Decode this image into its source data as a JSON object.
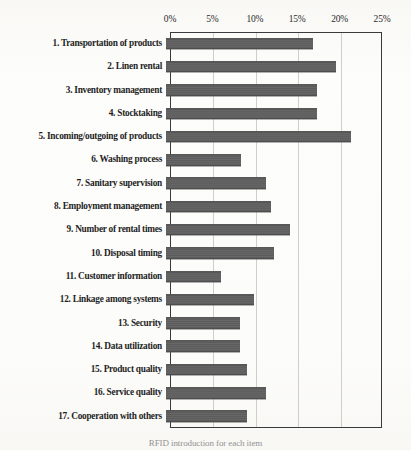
{
  "chart_data": {
    "type": "bar",
    "orientation": "horizontal",
    "title": "",
    "xlabel": "",
    "ylabel": "",
    "xlim": [
      0,
      25
    ],
    "xticks": [
      0,
      5,
      10,
      15,
      20,
      25
    ],
    "xtick_labels": [
      "0%",
      "5%",
      "10%",
      "15%",
      "20%",
      "25%"
    ],
    "x_axis_position": "top",
    "grid": true,
    "grid_axis": "x",
    "legend": "none",
    "bar_color": "#5e5e5e",
    "frame_color": "#3a3a3a",
    "categories": [
      "1. Transportation of products",
      "2. Linen rental",
      "3. Inventory management",
      "4. Stocktaking",
      "5. Incoming/outgoing of products",
      "6. Washing process",
      "7. Sanitary supervision",
      "8. Employment management",
      "9. Number of rental times",
      "10. Disposal timing",
      "11. Customer information",
      "12. Linkage among systems",
      "13. Security",
      "14. Data utilization",
      "15. Product quality",
      "16. Service quality",
      "17. Cooperation with others"
    ],
    "values": [
      17.3,
      20.1,
      17.8,
      17.8,
      21.8,
      8.8,
      11.8,
      12.4,
      14.6,
      12.7,
      6.5,
      10.4,
      8.7,
      8.7,
      9.5,
      11.8,
      9.5
    ]
  },
  "caption": {
    "text": "RFID introduction for each item"
  }
}
